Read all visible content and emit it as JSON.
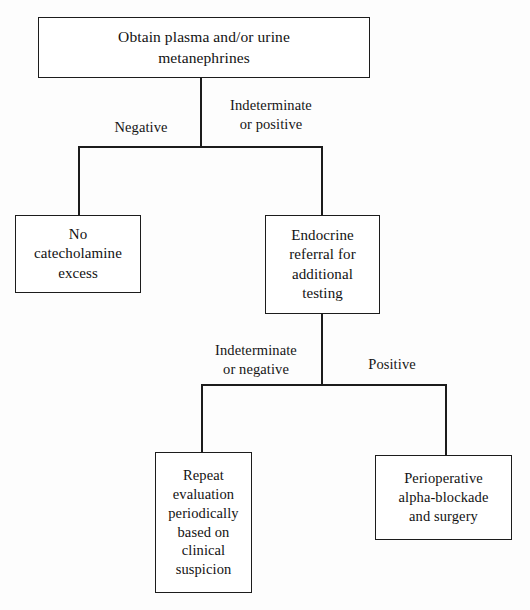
{
  "diagram": {
    "type": "flowchart",
    "background_color": "#fdfdfd",
    "line_color": "#1c1c1c",
    "text_color": "#121212",
    "nodes": [
      {
        "id": "obtain",
        "label": "Obtain plasma and/or urine\nmetanephrines",
        "shape": "rectangle"
      },
      {
        "id": "no_catecholamine",
        "label": "No\ncatecholamine\nexcess",
        "shape": "rectangle"
      },
      {
        "id": "endocrine_referral",
        "label": "Endocrine\nreferral for\nadditional\ntesting",
        "shape": "rectangle"
      },
      {
        "id": "repeat_evaluation",
        "label": "Repeat\nevaluation\nperiodically\nbased on\nclinical\nsuspicion",
        "shape": "rectangle"
      },
      {
        "id": "perioperative",
        "label": "Perioperative\nalpha-blockade\nand surgery",
        "shape": "rectangle"
      }
    ],
    "edge_labels": [
      {
        "id": "negative",
        "text": "Negative"
      },
      {
        "id": "indeterminate_pos",
        "text": "Indeterminate\nor positive"
      },
      {
        "id": "indeterminate_neg",
        "text": "Indeterminate\nor negative"
      },
      {
        "id": "positive",
        "text": "Positive"
      }
    ],
    "edges": [
      {
        "from": "obtain",
        "to": "no_catecholamine",
        "label": "Negative"
      },
      {
        "from": "obtain",
        "to": "endocrine_referral",
        "label": "Indeterminate or positive"
      },
      {
        "from": "endocrine_referral",
        "to": "repeat_evaluation",
        "label": "Indeterminate or negative"
      },
      {
        "from": "endocrine_referral",
        "to": "perioperative",
        "label": "Positive"
      }
    ]
  }
}
